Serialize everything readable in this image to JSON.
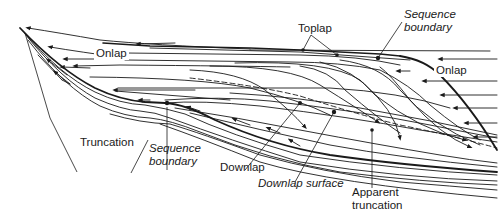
{
  "diagram": {
    "type": "sequence-stratigraphy-reflection-terminations",
    "labels": {
      "toplap": "Toplap",
      "sequence_boundary_top": [
        "Sequence",
        "boundary"
      ],
      "onlap_left": "Onlap",
      "onlap_right": "Onlap",
      "truncation": "Truncation",
      "sequence_boundary_bottom": [
        "Sequence",
        "boundary"
      ],
      "downlap": "Downlap",
      "downlap_surface": "Downlap surface",
      "apparent_truncation": [
        "Apparent",
        "truncation"
      ]
    },
    "colors": {
      "line": "#1a1a1a",
      "background": "#ffffff"
    }
  }
}
